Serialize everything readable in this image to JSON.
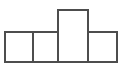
{
  "figure": {
    "type": "line-drawing",
    "canvas": {
      "width": 124,
      "height": 76,
      "background": "#ffffff"
    },
    "style": {
      "stroke_color": "#4d4d4d",
      "stroke_width": 1.6,
      "fill_color": "#ffffff"
    },
    "geometry": {
      "baseline_y": 62,
      "row_top_y": 32,
      "tall_top_y": 10,
      "left_x": 5,
      "right_x": 117,
      "dividers_x": [
        33,
        58,
        88
      ]
    },
    "cells": [
      {
        "name": "left-square",
        "label": "1",
        "x": 5,
        "y": 32,
        "width": 28,
        "height": 30
      },
      {
        "name": "middle-left-square",
        "label": "2",
        "x": 33,
        "y": 32,
        "width": 25,
        "height": 30
      },
      {
        "name": "center-tall-rectangle",
        "label": "3",
        "x": 58,
        "y": 10,
        "width": 30,
        "height": 52
      },
      {
        "name": "right-square",
        "label": "4",
        "x": 88,
        "y": 32,
        "width": 29,
        "height": 30
      }
    ],
    "counts": {
      "total_cells": 4,
      "base_row_cells": 3,
      "raised_cells": 1
    }
  }
}
